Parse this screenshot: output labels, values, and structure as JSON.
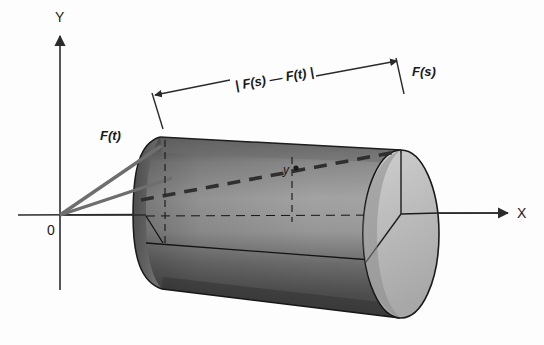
{
  "figure": {
    "background_color": "#fdfdfd",
    "axes": {
      "y_label": "Y",
      "x_label": "X",
      "origin_label": "0",
      "axis_color": "#2b2b2b"
    },
    "labels": {
      "vector_t": "F(t)",
      "vector_s": "F(s)",
      "distance": "| F(s) — F(t) |",
      "point_y": "y"
    },
    "colors": {
      "vector_stroke": "#6e6e6e",
      "chord_dash": "#3a3a3a",
      "cylinder_dark": "#4a4a4a",
      "cylinder_mid": "#8f8f8f",
      "cylinder_light": "#c9c9c9",
      "endcap_light": "#b9b9b9",
      "outline": "#1e1e1e",
      "text": "#1a1a1a"
    }
  }
}
